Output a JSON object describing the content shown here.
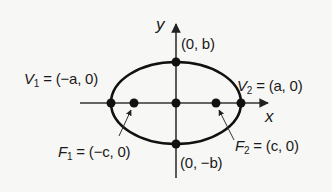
{
  "diagram": {
    "axes": {
      "x_label": "x",
      "y_label": "y"
    },
    "points": {
      "v1": {
        "name": "V",
        "sub": "1",
        "coords": "(−a, 0)"
      },
      "v2": {
        "name": "V",
        "sub": "2",
        "coords": "(a, 0)"
      },
      "f1": {
        "name": "F",
        "sub": "1",
        "coords": "(−c, 0)"
      },
      "f2": {
        "name": "F",
        "sub": "2",
        "coords": "(c, 0)"
      },
      "top": {
        "coords": "(0, b)"
      },
      "bottom": {
        "coords": "(0, −b)"
      }
    },
    "colors": {
      "stroke": "#111111",
      "background": "#f7f7f5",
      "axis": "#333333"
    }
  }
}
